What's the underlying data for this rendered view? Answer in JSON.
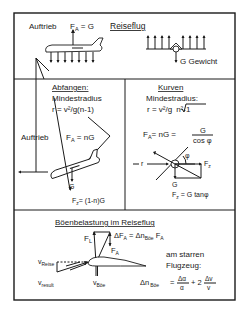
{
  "cruise": {
    "lift_label": "Auftrieb",
    "lift_formula_main": "F",
    "lift_formula_sub": "A",
    "lift_formula_rest": " = G",
    "title": "Reiseflug",
    "weight_label": "G  Gewicht"
  },
  "pullout": {
    "title": "Abfangen:",
    "radius_label": "Mindestradius",
    "radius_formula": "r = v²/g(n-1)",
    "lift_label": "Auftrieb",
    "lift_formula_main": "F",
    "lift_formula_sub": "A",
    "lift_formula_rest": " = nG",
    "weight_label": "G",
    "fz_main": "F",
    "fz_sub": "z",
    "fz_rest": "= (1-n)G"
  },
  "turn": {
    "title": "Kurven",
    "radius_label": "Mindestradius:",
    "radius_formula_a": "r  = v²/g",
    "radius_formula_b": "n²-1",
    "lift_main": "F",
    "lift_sub": "A",
    "lift_rest": "= nG  =",
    "frac_num": "G",
    "frac_den": "cos φ",
    "phi": "φ",
    "r_label": "r",
    "fz_main": "F",
    "fz_sub": "z",
    "weight_label": "G",
    "fz_formula_main": "F",
    "fz_formula_sub": "z",
    "fz_formula_rest": " = G tanφ"
  },
  "gust": {
    "title": "Böenbelastung  im  Reiseflug",
    "fl_main": "F",
    "fl_sub": "L",
    "dfa_main": "ΔF",
    "dfa_sub": "A",
    "dfa_rest": " = Δn",
    "dfa_sub2": "Böe",
    "dfa_tail": "  F",
    "dfa_sub3": "A",
    "fa_main": "F",
    "fa_sub": "A",
    "v_reise_main": "v",
    "v_reise_sub": "Reise",
    "v_result_main": "v",
    "v_result_sub": "result",
    "v_boe_main": "v",
    "v_boe_sub": "Böe",
    "rigid_line1": "am starren",
    "rigid_line2": "Flugzeug:",
    "dn_main": "Δn",
    "dn_sub": "Böe",
    "eq": "=",
    "frac1_num": "Δα",
    "frac1_den": "α",
    "plus": "+ 2",
    "frac2_num": "Δv",
    "frac2_den": "v"
  }
}
